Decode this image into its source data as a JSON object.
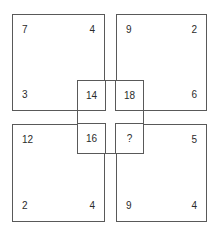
{
  "figure": {
    "ink_color": "#595959",
    "text_color": "#2b2b2b",
    "background": "#ffffff"
  },
  "squares": {
    "top_left": {
      "top_left": "7",
      "top_right": "4",
      "bottom_left": "3"
    },
    "top_right": {
      "top_left": "9",
      "top_right": "2",
      "bottom_right": "6"
    },
    "bottom_left": {
      "top_left": "12",
      "bottom_left": "2",
      "bottom_right": "4"
    },
    "bottom_right": {
      "top_right": "5",
      "bottom_left": "9",
      "bottom_right": "4"
    }
  },
  "center": {
    "top_left": "14",
    "top_right": "18",
    "bottom_left": "16",
    "bottom_right": "?"
  },
  "chart_data": {
    "type": "table",
    "categories": [
      "top-left",
      "top-right",
      "bottom-left",
      "bottom-right"
    ],
    "outer_corner_values": {
      "top_left_square": [
        7,
        4,
        3
      ],
      "top_right_square": [
        9,
        2,
        6
      ],
      "bottom_left_square": [
        12,
        2,
        4
      ],
      "bottom_right_square": [
        5,
        9,
        4
      ]
    },
    "center_values": [
      "14",
      "18",
      "16",
      "?"
    ]
  }
}
